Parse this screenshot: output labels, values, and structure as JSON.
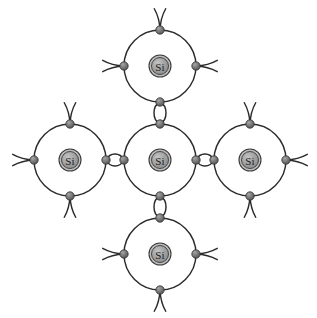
{
  "figure": {
    "name": "silicon-covalent-bond-lattice",
    "background_color": "#ffffff",
    "width": 317,
    "height": 318,
    "element_symbol": "Si",
    "element_label": "Si"
  },
  "style": {
    "line_color": "#2b2b2b",
    "line_width": 1.45,
    "nucleus_fill": "#9c9c9c",
    "nucleus_stroke": "#3a3a3a",
    "nucleus_highlight": "#bdbdbd",
    "electron_fill": "#6e6e6e",
    "electron_highlight": "#9a9a9a",
    "electron_stroke": "#2f2f2f",
    "label_color": "#1b1b1b",
    "orbit_fill": "#ffffff"
  },
  "geometry": {
    "orbit_radius": 36,
    "nucleus_radius": 11,
    "nucleus_inner_radius": 8.5,
    "electron_radius": 4.2,
    "bond_lens_half_height": 8,
    "antenna_length": 22,
    "antenna_spread_deg": 15
  },
  "atoms": [
    {
      "id": "center",
      "label": "Si",
      "cx": 160,
      "cy": 160
    },
    {
      "id": "top",
      "label": "Si",
      "cx": 160,
      "cy": 66
    },
    {
      "id": "bottom",
      "label": "Si",
      "cx": 160,
      "cy": 254
    },
    {
      "id": "left",
      "label": "Si",
      "cx": 70,
      "cy": 160
    },
    {
      "id": "right",
      "label": "Si",
      "cx": 250,
      "cy": 160
    }
  ],
  "bonds": [
    {
      "id": "bond-center-top",
      "from": "center",
      "to": "top",
      "orientation": "vertical",
      "x": 160,
      "y1": 124,
      "y2": 102
    },
    {
      "id": "bond-center-bottom",
      "from": "center",
      "to": "bottom",
      "orientation": "vertical",
      "x": 160,
      "y1": 196,
      "y2": 218
    },
    {
      "id": "bond-center-left",
      "from": "center",
      "to": "left",
      "orientation": "horizontal",
      "y": 160,
      "x1": 124,
      "x2": 106
    },
    {
      "id": "bond-center-right",
      "from": "center",
      "to": "right",
      "orientation": "horizontal",
      "y": 160,
      "x1": 196,
      "x2": 214
    }
  ],
  "free_electrons": [
    {
      "id": "free-top-up",
      "atom": "top",
      "angle_deg": 270,
      "cx": 160,
      "cy": 30
    },
    {
      "id": "free-top-left",
      "atom": "top",
      "angle_deg": 180,
      "cx": 124,
      "cy": 66
    },
    {
      "id": "free-top-right",
      "atom": "top",
      "angle_deg": 0,
      "cx": 196,
      "cy": 66
    },
    {
      "id": "free-bottom-down",
      "atom": "bottom",
      "angle_deg": 90,
      "cx": 160,
      "cy": 290
    },
    {
      "id": "free-bottom-left",
      "atom": "bottom",
      "angle_deg": 180,
      "cx": 124,
      "cy": 254
    },
    {
      "id": "free-bottom-right",
      "atom": "bottom",
      "angle_deg": 0,
      "cx": 196,
      "cy": 254
    },
    {
      "id": "free-left-up",
      "atom": "left",
      "angle_deg": 270,
      "cx": 70,
      "cy": 124
    },
    {
      "id": "free-left-down",
      "atom": "left",
      "angle_deg": 90,
      "cx": 70,
      "cy": 196
    },
    {
      "id": "free-left-left",
      "atom": "left",
      "angle_deg": 180,
      "cx": 34,
      "cy": 160
    },
    {
      "id": "free-right-up",
      "atom": "right",
      "angle_deg": 270,
      "cx": 250,
      "cy": 124
    },
    {
      "id": "free-right-down",
      "atom": "right",
      "angle_deg": 90,
      "cx": 250,
      "cy": 196
    },
    {
      "id": "free-right-right",
      "atom": "right",
      "angle_deg": 0,
      "cx": 286,
      "cy": 160
    }
  ]
}
